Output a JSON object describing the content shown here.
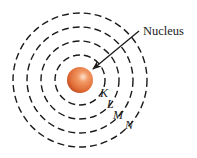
{
  "diagram": {
    "nucleus": {
      "label": "Nucleus",
      "color": "#e8703a",
      "highlight": "#fbd0b0",
      "shadow": "#b8461c"
    },
    "shells": [
      {
        "label": "K",
        "radius": 25
      },
      {
        "label": "L",
        "radius": 39
      },
      {
        "label": "M",
        "radius": 53
      },
      {
        "label": "N",
        "radius": 67
      }
    ],
    "stroke_color": "#1a1a1a"
  }
}
